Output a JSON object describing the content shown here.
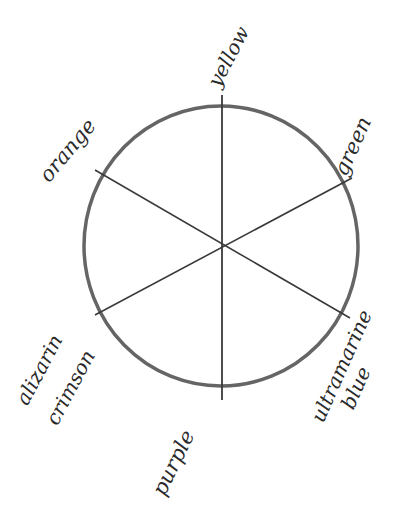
{
  "diagram": {
    "type": "color-wheel",
    "style": "hand-drawn pencil sketch",
    "background": "#ffffff",
    "stroke_color": "#4a4a4a",
    "circle": {
      "cx": 221,
      "cy": 246,
      "rx": 137,
      "ry": 140
    },
    "spokes": [
      {
        "from": "yellow",
        "to": "purple",
        "x1": 222,
        "y1": 95,
        "x2": 222,
        "y2": 400
      },
      {
        "from": "orange",
        "to": "ultramarine blue",
        "x1": 95,
        "y1": 170,
        "x2": 350,
        "y2": 318
      },
      {
        "from": "alizarin crimson",
        "to": "green",
        "x1": 95,
        "y1": 315,
        "x2": 352,
        "y2": 178
      }
    ],
    "labels": {
      "yellow": "yellow",
      "green": "green",
      "ultramarine_line1": "ultramarine",
      "ultramarine_line2": "blue",
      "purple": "purple",
      "alizarin_line1": "alizarin",
      "alizarin_line2": "crimson",
      "orange": "orange"
    }
  }
}
